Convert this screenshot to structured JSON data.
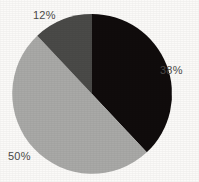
{
  "chart_data": {
    "type": "pie",
    "title": "",
    "subtitle": "",
    "xlabel": "",
    "ylabel": "",
    "legend": "none",
    "grid": false,
    "labels_shown": "percent",
    "start_angle_deg": 0,
    "direction": "clockwise",
    "categories": [
      "38%",
      "50%",
      "12%"
    ],
    "values": [
      38,
      50,
      12
    ],
    "total": 100,
    "slices": [
      {
        "label": "38%",
        "value": 38,
        "color": "#100c0c",
        "color_name": "black",
        "start_deg": 0,
        "end_deg": 136.8,
        "label_position": "right"
      },
      {
        "label": "50%",
        "value": 50,
        "color": "#a9a9a7",
        "color_name": "light-gray",
        "start_deg": 136.8,
        "end_deg": 316.8,
        "label_position": "bottom-left"
      },
      {
        "label": "12%",
        "value": 12,
        "color": "#4a4a48",
        "color_name": "dark-gray",
        "start_deg": 316.8,
        "end_deg": 360,
        "label_position": "top"
      }
    ]
  },
  "figure": {
    "background_color": "#fbfaf8",
    "label_text_color": "#4c4a48",
    "center_x": 92,
    "center_y": 94,
    "radius": 80
  }
}
